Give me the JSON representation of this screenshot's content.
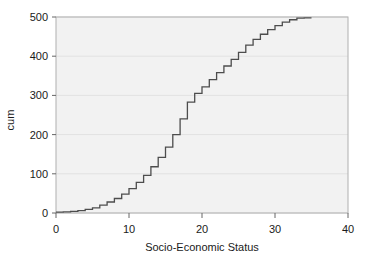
{
  "chart_data": {
    "type": "line",
    "subtype": "step-cumulative-ogive",
    "title": "",
    "xlabel": "Socio-Economic Status",
    "ylabel": "cum",
    "xlim": [
      0,
      40
    ],
    "ylim": [
      0,
      500
    ],
    "xticks": [
      0,
      10,
      20,
      30,
      40
    ],
    "yticks": [
      0,
      100,
      200,
      300,
      400,
      500
    ],
    "xtick_labels": [
      "0",
      "10",
      "20",
      "30",
      "40"
    ],
    "ytick_labels": [
      "0",
      "100",
      "200",
      "300",
      "400",
      "500"
    ],
    "grid": "horizontal-only",
    "legend": "none",
    "series": [
      {
        "name": "cum",
        "step_type": "post",
        "x": [
          0,
          1,
          2,
          3,
          4,
          5,
          6,
          7,
          8,
          9,
          10,
          11,
          12,
          13,
          14,
          15,
          16,
          17,
          18,
          19,
          20,
          21,
          22,
          23,
          24,
          25,
          26,
          27,
          28,
          29,
          30,
          31,
          32,
          33,
          34,
          35
        ],
        "values": [
          2,
          3,
          4,
          6,
          9,
          13,
          20,
          28,
          37,
          48,
          62,
          78,
          96,
          118,
          142,
          168,
          200,
          240,
          283,
          305,
          322,
          340,
          358,
          375,
          392,
          410,
          428,
          443,
          456,
          468,
          478,
          487,
          493,
          497,
          498,
          498
        ]
      }
    ]
  },
  "axes": {
    "y_title": "cum",
    "x_title": "Socio-Economic Status"
  },
  "colors": {
    "line": "#4d4d4d",
    "plot_background": "#f2f2f2",
    "figure_background": "#ffffff",
    "grid": "#e2e2e2",
    "border": "#b0b0b0",
    "text": "#1a1a1a"
  }
}
